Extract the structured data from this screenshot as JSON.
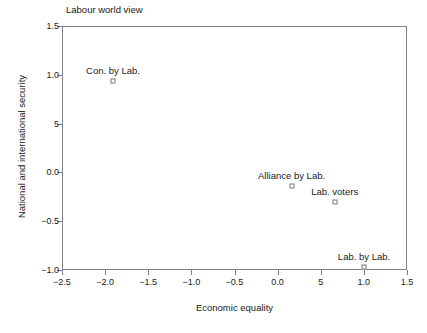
{
  "chart_data": {
    "type": "scatter",
    "title": "Labour world view",
    "xlabel": "Economic equality",
    "ylabel": "National and international security",
    "xlim": [
      -2.5,
      1.5
    ],
    "ylim": [
      -1.0,
      1.5
    ],
    "grid": false,
    "legend": "none",
    "xticks": [
      {
        "value": -2.5,
        "label": "−2.5"
      },
      {
        "value": -2.0,
        "label": "−2.0"
      },
      {
        "value": -1.5,
        "label": "−1.5"
      },
      {
        "value": -1.0,
        "label": "−1.0"
      },
      {
        "value": -0.5,
        "label": "−0.5"
      },
      {
        "value": 0.0,
        "label": "0.0"
      },
      {
        "value": 0.5,
        "label": "5"
      },
      {
        "value": 1.0,
        "label": "1.0"
      },
      {
        "value": 1.5,
        "label": "1.5"
      }
    ],
    "yticks": [
      {
        "value": 1.5,
        "label": "1.5"
      },
      {
        "value": 1.0,
        "label": "1.0"
      },
      {
        "value": 0.5,
        "label": "5"
      },
      {
        "value": 0.0,
        "label": "0.0"
      },
      {
        "value": -0.5,
        "label": "−0.5"
      },
      {
        "value": -1.0,
        "label": "−1.0"
      }
    ],
    "points": [
      {
        "label": "Con. by Lab.",
        "x": -1.92,
        "y": 0.95
      },
      {
        "label": "Alliance by Lab.",
        "x": 0.15,
        "y": -0.13
      },
      {
        "label": "Lab. voters",
        "x": 0.65,
        "y": -0.29
      },
      {
        "label": "Lab. by Lab.",
        "x": 0.99,
        "y": -0.96
      }
    ]
  }
}
